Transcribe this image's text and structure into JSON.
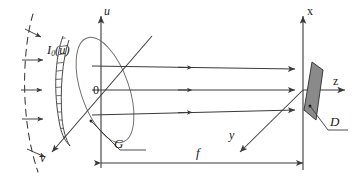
{
  "figure": {
    "background_color": "#ffffff",
    "line_color": "#3a3a3a",
    "detector_fill": "#8a8a8a",
    "detector_stroke": "#2b2b2b"
  },
  "labels": {
    "incident_field": "I",
    "incident_field_sub": "0",
    "incident_field_arg": "(u)",
    "axis_u": "u",
    "axis_v": "v",
    "origin": "0",
    "grating": "G",
    "axis_x": "x",
    "axis_y": "y",
    "axis_z": "z",
    "detector": "D",
    "focal_length": "f"
  },
  "elements": {
    "wavefront": {
      "name": "dashed-wavefront",
      "style": "dashed-arc",
      "arrow_count": 5
    },
    "grating_disc": {
      "name": "grating-ellipse",
      "hatched_edge": true,
      "tilt_deg": -18
    },
    "rays": {
      "count": 3,
      "direction": "left-to-right",
      "converge_at": "detector"
    },
    "detector_shape": "parallelogram",
    "dimension_line": {
      "from": "grating-plane",
      "to": "detector-plane",
      "label": "f"
    }
  }
}
